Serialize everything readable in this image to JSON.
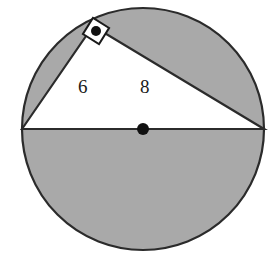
{
  "figure": {
    "type": "geometry-diagram",
    "background_color": "#ffffff",
    "shaded_color": "#a9a9a9",
    "unshaded_color": "#ffffff",
    "outline_color": "#2b2b2b",
    "label_color": "#1a1a1a",
    "circle": {
      "center_x": 143,
      "center_y": 129,
      "radius": 121,
      "stroke_width": 2.2
    },
    "center_point": {
      "name": "center-dot",
      "x": 143,
      "y": 129,
      "radius": 6,
      "color": "#111111"
    },
    "diameter": {
      "name": "hypotenuse",
      "x1": 22,
      "y1": 129,
      "x2": 264,
      "y2": 129,
      "stroke_width": 2.2
    },
    "apex": {
      "name": "right-angle-vertex",
      "x": 93,
      "y": 26
    },
    "triangle": {
      "points": "22,129 93,26 264,129",
      "fill": "#ffffff",
      "stroke_width": 2.2
    },
    "right_angle_marker": {
      "name": "right-angle-square",
      "size": 19,
      "rotation_deg": 32,
      "dot_radius": 5,
      "fill": "#ffffff",
      "stroke": "#1a1a1a",
      "stroke_width": 2,
      "dot_color": "#111111"
    },
    "labels": [
      {
        "id": "leg-a",
        "text": "6",
        "x": 78,
        "y": 77,
        "meaning": "length of left leg"
      },
      {
        "id": "leg-b",
        "text": "8",
        "x": 140,
        "y": 77,
        "meaning": "length of right leg"
      }
    ]
  }
}
